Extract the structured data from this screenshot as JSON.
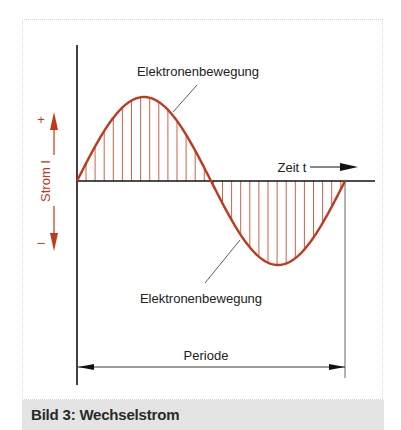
{
  "figure": {
    "caption": "Bild 3: Wechselstrom",
    "labels": {
      "upper_curve": "Elektronenbewegung",
      "lower_curve": "Elektronenbewegung",
      "x_axis": "Zeit t",
      "y_axis": "Strom I",
      "plus": "+",
      "minus": "–",
      "period": "Periode"
    },
    "colors": {
      "curve": "#c0391b",
      "axis": "#111111",
      "caption_bg": "#e4e4e4"
    }
  }
}
